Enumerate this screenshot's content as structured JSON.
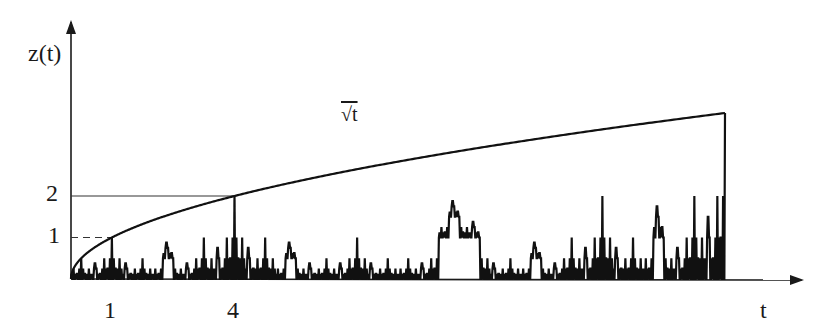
{
  "chart_data": {
    "type": "line",
    "title": "",
    "xlabel": "t",
    "ylabel": "z(t)",
    "xlim": [
      0,
      16
    ],
    "ylim": [
      0,
      4
    ],
    "x_ticks": [
      {
        "value": 1,
        "label": "1"
      },
      {
        "value": 4,
        "label": "4"
      }
    ],
    "y_ticks": [
      {
        "value": 1,
        "label": "1"
      },
      {
        "value": 2,
        "label": "2"
      }
    ],
    "grid": false,
    "annotations": [
      {
        "text": "√t",
        "x": 7.3,
        "y": 3.3,
        "describes": "upper envelope curve"
      }
    ],
    "reference_lines": [
      {
        "type": "dashed",
        "from": [
          0,
          1
        ],
        "to": [
          1,
          1
        ]
      },
      {
        "type": "dashed",
        "from": [
          1,
          0
        ],
        "to": [
          1,
          1
        ]
      },
      {
        "type": "solid",
        "from": [
          0,
          2
        ],
        "to": [
          4,
          2
        ]
      },
      {
        "type": "dashed",
        "from": [
          4,
          0
        ],
        "to": [
          4,
          2
        ]
      }
    ],
    "series": [
      {
        "name": "sqrt(t)",
        "style": "smooth",
        "x": [
          0,
          1,
          4,
          9,
          16
        ],
        "y": [
          0,
          1,
          2,
          3,
          4
        ]
      },
      {
        "name": "z(t)",
        "style": "self-similar zigzag",
        "x": [
          0,
          1,
          2,
          3,
          4,
          8,
          12,
          16
        ],
        "y": [
          0,
          1,
          0,
          0,
          2,
          0,
          0,
          4
        ]
      }
    ]
  },
  "labels": {
    "y_axis": "z(t)",
    "x_axis": "t",
    "curve": "√t",
    "tick_x1": "1",
    "tick_x4": "4",
    "tick_y1": "1",
    "tick_y2": "2"
  }
}
